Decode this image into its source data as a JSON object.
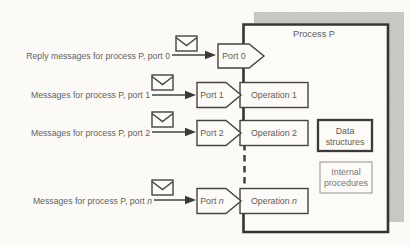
{
  "figure": {
    "process": {
      "title": "Process P"
    },
    "rows": [
      {
        "message": "Reply messages for process P, port 0",
        "port_label": "Port 0"
      },
      {
        "message": "Messages for process P, port 1",
        "port_label": "Port 1",
        "operation_label": "Operation 1"
      },
      {
        "message": "Messages for process P, port 2",
        "port_label": "Port 2",
        "operation_label": "Operation 2"
      },
      {
        "message_prefix": "Messages for process P, port ",
        "variable": "n",
        "port_prefix": "Port ",
        "operation_prefix": "Operation "
      }
    ],
    "internal_components": [
      {
        "line1": "Data",
        "line2": "structures",
        "emphasis": true
      },
      {
        "line1": "Internal",
        "line2": "procedures",
        "emphasis": false
      }
    ],
    "icons": {
      "envelope": "envelope-icon"
    },
    "colors": {
      "line": "#3b3a36",
      "text": "#64635f",
      "shadow": "#c9c8c4",
      "paper": "#fbfaf7"
    }
  }
}
